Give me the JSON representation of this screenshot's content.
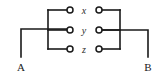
{
  "diagram": {
    "type": "circuit-schematic",
    "canvas": {
      "width": 160,
      "height": 75
    },
    "colors": {
      "background": "#ffffff",
      "wire": "#1a1a1a",
      "terminal_fill": "#ffffff",
      "terminal_stroke": "#1a1a1a",
      "node_label": "#2b2b2b",
      "end_label": "#1a1a1a"
    },
    "branch_labels": [
      {
        "id": "x",
        "text": "x",
        "cx": 84,
        "cy": 13
      },
      {
        "id": "y",
        "text": "y",
        "cx": 84,
        "cy": 33
      },
      {
        "id": "z",
        "text": "z",
        "cx": 84,
        "cy": 52
      }
    ],
    "end_labels": [
      {
        "id": "A",
        "text": "A",
        "cx": 21,
        "cy": 70
      },
      {
        "id": "B",
        "text": "B",
        "cx": 148,
        "cy": 70
      }
    ],
    "left_terminals": [
      {
        "id": "x-left",
        "cx": 70,
        "cy": 10,
        "r": 3
      },
      {
        "id": "y-left",
        "cx": 70,
        "cy": 30,
        "r": 3
      },
      {
        "id": "z-left",
        "cx": 70,
        "cy": 49,
        "r": 3
      }
    ],
    "right_terminals": [
      {
        "id": "x-right",
        "cx": 99,
        "cy": 10,
        "r": 3
      },
      {
        "id": "y-right",
        "cx": 99,
        "cy": 30,
        "r": 3
      },
      {
        "id": "z-right",
        "cx": 99,
        "cy": 49,
        "r": 3
      }
    ],
    "wires": {
      "lead_a": "M21,57 L21,29 L67,29",
      "lead_b": "M148,57 L148,30 L102,30",
      "bus_left": "M48,10 L48,49",
      "bus_right": "M120,10 L120,49",
      "stub_left_x": "M48,10 L67,10",
      "stub_left_y": "M48,30 L67,30",
      "stub_left_z": "M48,49 L67,49",
      "stub_right_x": "M102,10 L120,10",
      "stub_right_y": "M102,30 L120,30",
      "stub_right_z": "M102,49 L120,49"
    }
  }
}
